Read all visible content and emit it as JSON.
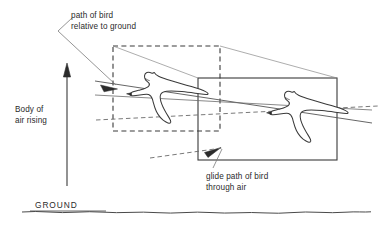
{
  "figure": {
    "background_color": "#ffffff",
    "line_color": "#3a3a3a",
    "text_color": "#2b2b2b",
    "width": 380,
    "height": 225
  },
  "labels": {
    "path_of_bird": "path of bird\nrelative to ground",
    "glide_path": "glide path of bird\nthrough air",
    "body_of_air": "Body of\nair rising",
    "ground": "GROUND"
  },
  "elements": {
    "dashed_box_name": "body-of-air-box-position-1",
    "solid_box_name": "body-of-air-box-position-2",
    "bird_left_name": "bird-earlier-position",
    "bird_right_name": "bird-later-position",
    "rising_air_arrow_name": "rising-air-arrow",
    "ground_line_name": "ground-line"
  }
}
